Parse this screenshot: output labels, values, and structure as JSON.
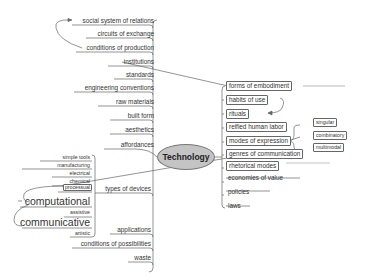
{
  "mindmap": {
    "center": "Technology",
    "left_branches": [
      {
        "label": "social system of relations"
      },
      {
        "label": "circuits of exchange"
      },
      {
        "label": "conditions of production"
      },
      {
        "label": "institutions"
      },
      {
        "label": "standards"
      },
      {
        "label": "engineering conventions"
      },
      {
        "label": "raw materials"
      },
      {
        "label": "built form"
      },
      {
        "label": "aesthetics"
      },
      {
        "label": "affordances"
      },
      {
        "label": "types of devices"
      },
      {
        "label": "applications"
      },
      {
        "label": "conditions of possibilities"
      },
      {
        "label": "waste"
      }
    ],
    "device_types": [
      {
        "label": "simple tools"
      },
      {
        "label": "manufacturing"
      },
      {
        "label": "electrical"
      },
      {
        "label": "chemical"
      },
      {
        "label": "processual"
      },
      {
        "label": "computational"
      },
      {
        "label": "assistive"
      },
      {
        "label": "communicative"
      },
      {
        "label": "artistic"
      }
    ],
    "right_branches": [
      {
        "label": "forms of embodiment"
      },
      {
        "label": "habits of use"
      },
      {
        "label": "rituals"
      },
      {
        "label": "reified human labor"
      },
      {
        "label": "modes of expression"
      },
      {
        "label": "genres of communication"
      },
      {
        "label": "rhetorical modes"
      },
      {
        "label": "economies of value"
      },
      {
        "label": "policies"
      },
      {
        "label": "laws"
      }
    ],
    "expression_modes": [
      {
        "label": "singular"
      },
      {
        "label": "combinatory"
      },
      {
        "label": "multimodal"
      }
    ]
  }
}
